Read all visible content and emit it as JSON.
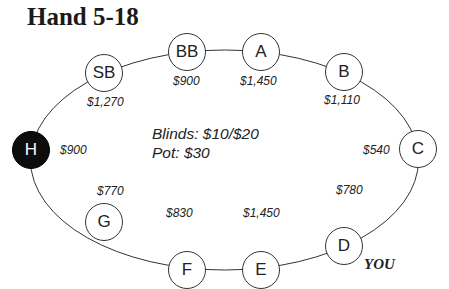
{
  "title": "Hand 5-18",
  "info": {
    "blinds": "Blinds: $10/$20",
    "pot": "Pot: $30"
  },
  "hero_label": "YOU",
  "colors": {
    "seat_fill": "#ffffff",
    "highlight_seat_fill": "#0d0d0d",
    "line": "#333333"
  },
  "seats": [
    {
      "label": "SB",
      "stack": "$1,270"
    },
    {
      "label": "BB",
      "stack": "$900"
    },
    {
      "label": "A",
      "stack": "$1,450"
    },
    {
      "label": "B",
      "stack": "$1,110"
    },
    {
      "label": "C",
      "stack": "$540"
    },
    {
      "label": "D",
      "stack": "$780"
    },
    {
      "label": "E",
      "stack": "$1,450"
    },
    {
      "label": "F",
      "stack": "$830"
    },
    {
      "label": "G",
      "stack": "$770"
    },
    {
      "label": "H",
      "stack": "$900"
    }
  ]
}
